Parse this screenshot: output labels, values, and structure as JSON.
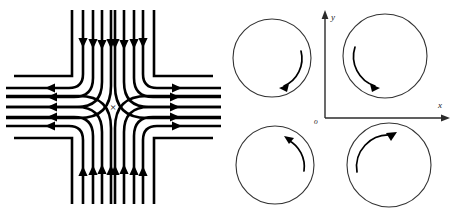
{
  "figure": {
    "background_color": "#ffffff",
    "stroke_color": "#000000",
    "axis_color": "#2b2b2b",
    "width": 454,
    "height": 214,
    "panels": [
      {
        "id": "saddle",
        "name": "saddle-point-streamline-diagram"
      },
      {
        "id": "vortex",
        "name": "quadrant-circulation-diagram"
      }
    ]
  },
  "saddle": {
    "center_mark": "×",
    "center_x": 113,
    "center_y": 107,
    "line_width": 2.6,
    "arrows": {
      "top_direction": "down",
      "bottom_direction": "up",
      "left_direction": "left",
      "right_direction": "right",
      "top_count": 4,
      "bottom_count": 4,
      "left_count": 4,
      "right_count": 4
    },
    "streamline_offsets": [
      9,
      19,
      29,
      39,
      52,
      66
    ]
  },
  "vortex": {
    "axis": {
      "origin_x": 98,
      "origin_y": 118,
      "y_axis_top": 12,
      "x_axis_right": 222,
      "x_label": "x",
      "y_label": "y",
      "origin_label": "o"
    },
    "circles": [
      {
        "name": "top-left-circle",
        "quadrant": "II",
        "cx": 45,
        "cy": 58,
        "r": 39,
        "rotation": "clockwise",
        "arc_start_deg": -70,
        "arc_end_deg": 58,
        "arc_r": 30
      },
      {
        "name": "top-right-circle",
        "quadrant": "I",
        "cx": 158,
        "cy": 56,
        "r": 42,
        "rotation": "clockwise",
        "arc_start_deg": 190,
        "arc_end_deg": 78,
        "arc_r": 31
      },
      {
        "name": "bottom-left-circle",
        "quadrant": "III",
        "cx": 48,
        "cy": 165,
        "r": 39,
        "rotation": "counterclockwise",
        "arc_start_deg": 20,
        "arc_end_deg": -80,
        "arc_r": 30
      },
      {
        "name": "bottom-right-circle",
        "quadrant": "IV",
        "cx": 162,
        "cy": 165,
        "r": 42,
        "rotation": "clockwise",
        "arc_start_deg": 180,
        "arc_end_deg": -70,
        "arc_r": 32
      }
    ]
  }
}
